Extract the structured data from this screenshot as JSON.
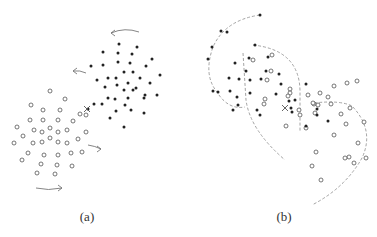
{
  "figure": {
    "panels": [
      {
        "label": "(a)",
        "label_pos": [
          87,
          218
        ],
        "filled_points": [
          [
            119,
            44
          ],
          [
            137,
            47
          ],
          [
            103,
            52
          ],
          [
            118,
            53
          ],
          [
            132,
            54
          ],
          [
            152,
            59
          ],
          [
            91,
            66
          ],
          [
            103,
            65
          ],
          [
            118,
            62
          ],
          [
            130,
            63
          ],
          [
            146,
            66
          ],
          [
            160,
            75
          ],
          [
            97,
            80
          ],
          [
            108,
            78
          ],
          [
            124,
            72
          ],
          [
            133,
            72
          ],
          [
            140,
            78
          ],
          [
            116,
            78
          ],
          [
            128,
            83
          ],
          [
            150,
            83
          ],
          [
            145,
            95
          ],
          [
            124,
            90
          ],
          [
            133,
            90
          ],
          [
            117,
            85
          ],
          [
            105,
            87
          ],
          [
            136,
            88
          ],
          [
            128,
            98
          ],
          [
            115,
            99
          ],
          [
            108,
            98
          ],
          [
            125,
            105
          ],
          [
            144,
            98
          ],
          [
            157,
            95
          ],
          [
            94,
            104
          ],
          [
            102,
            104
          ],
          [
            88,
            109
          ],
          [
            116,
            111
          ],
          [
            131,
            110
          ],
          [
            144,
            113
          ],
          [
            110,
            118
          ],
          [
            124,
            127
          ]
        ],
        "open_points": [
          [
            50,
            91
          ],
          [
            65,
            99
          ],
          [
            31,
            105
          ],
          [
            43,
            110
          ],
          [
            60,
            110
          ],
          [
            30,
            120
          ],
          [
            43,
            120
          ],
          [
            58,
            120
          ],
          [
            73,
            121
          ],
          [
            86,
            115
          ],
          [
            80,
            114
          ],
          [
            17,
            127
          ],
          [
            23,
            136
          ],
          [
            34,
            130
          ],
          [
            42,
            132
          ],
          [
            50,
            128
          ],
          [
            58,
            132
          ],
          [
            67,
            130
          ],
          [
            14,
            143
          ],
          [
            33,
            143
          ],
          [
            42,
            142
          ],
          [
            50,
            138
          ],
          [
            58,
            142
          ],
          [
            67,
            143
          ],
          [
            78,
            139
          ],
          [
            86,
            132
          ],
          [
            28,
            153
          ],
          [
            44,
            155
          ],
          [
            58,
            155
          ],
          [
            71,
            153
          ],
          [
            82,
            152
          ],
          [
            22,
            160
          ],
          [
            41,
            164
          ],
          [
            57,
            165
          ],
          [
            72,
            166
          ],
          [
            37,
            173
          ],
          [
            55,
            174
          ]
        ],
        "cross": [
          87,
          109
        ],
        "arrows": [
          {
            "path": "M139,32 Q125,27 111,33",
            "head": "left"
          },
          {
            "path": "M86,73 Q80,70 73,71",
            "head": "left"
          },
          {
            "path": "M88,145 Q95,146 101,149",
            "head": "right"
          },
          {
            "path": "M36,188 Q48,191 62,188",
            "head": "right"
          }
        ]
      },
      {
        "label": "(b)",
        "label_pos": [
          284,
          218
        ],
        "filled_points": [
          [
            260,
            15
          ],
          [
            221,
            31
          ],
          [
            227,
            32
          ],
          [
            212,
            47
          ],
          [
            208,
            59
          ],
          [
            268,
            57
          ],
          [
            255,
            45
          ],
          [
            235,
            63
          ],
          [
            249,
            58
          ],
          [
            246,
            71
          ],
          [
            229,
            78
          ],
          [
            239,
            79
          ],
          [
            250,
            80
          ],
          [
            261,
            79
          ],
          [
            266,
            71
          ],
          [
            230,
            91
          ],
          [
            213,
            91
          ],
          [
            218,
            92
          ],
          [
            237,
            97
          ],
          [
            250,
            93
          ],
          [
            238,
            105
          ],
          [
            233,
            110
          ],
          [
            257,
            110
          ],
          [
            260,
            115
          ],
          [
            276,
            94
          ],
          [
            281,
            84
          ],
          [
            279,
            74
          ],
          [
            289,
            101
          ],
          [
            291,
            108
          ],
          [
            292,
            112
          ],
          [
            295,
            100
          ],
          [
            306,
            84
          ],
          [
            306,
            126
          ],
          [
            317,
            109
          ],
          [
            328,
            121
          ],
          [
            317,
            115
          ]
        ],
        "open_points": [
          [
            272,
            55
          ],
          [
            253,
            60
          ],
          [
            271,
            71
          ],
          [
            267,
            80
          ],
          [
            265,
            99
          ],
          [
            264,
            104
          ],
          [
            290,
            89
          ],
          [
            290,
            93
          ],
          [
            299,
            110
          ],
          [
            314,
            104
          ],
          [
            308,
            95
          ],
          [
            315,
            113
          ],
          [
            286,
            126
          ],
          [
            300,
            115
          ],
          [
            306,
            128
          ],
          [
            318,
            105
          ],
          [
            320,
            93
          ],
          [
            331,
            104
          ],
          [
            328,
            97
          ],
          [
            334,
            86
          ],
          [
            341,
            114
          ],
          [
            347,
            83
          ],
          [
            350,
            108
          ],
          [
            364,
            122
          ],
          [
            357,
            81
          ],
          [
            346,
            124
          ],
          [
            334,
            135
          ],
          [
            358,
            143
          ],
          [
            366,
            158
          ],
          [
            354,
            163
          ],
          [
            349,
            157
          ],
          [
            345,
            158
          ],
          [
            312,
            166
          ],
          [
            321,
            180
          ],
          [
            316,
            152
          ],
          [
            313,
            103
          ],
          [
            288,
            96
          ]
        ],
        "cross": [
          285,
          108
        ],
        "dashed_curves": [
          "M260,15 Q225,20 213,47 Q203,75 217,92 Q228,110 245,107",
          "M253,45 Q300,50 300,92 L300,131",
          "M243,53 L246,100 Q250,130 285,160",
          "M314,103 Q340,100 352,106 Q375,130 362,158 Q345,188 312,205"
        ]
      }
    ]
  },
  "colors": {
    "filled": "#222222",
    "open_stroke": "#555555",
    "curve": "#999999",
    "background": "#ffffff"
  }
}
